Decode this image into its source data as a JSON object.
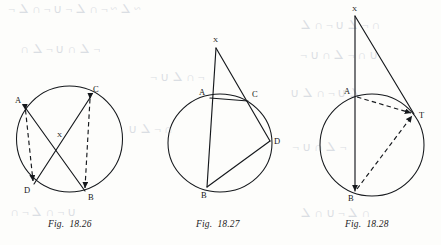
{
  "page": {
    "background_color": "#fdfdfb",
    "ink_color": "#15181c"
  },
  "figures": [
    {
      "id": "fig-18-26",
      "caption_prefix": "Fig.",
      "caption_number": "18.26",
      "circle": {
        "cx": 69.5,
        "cy": 139,
        "rx": 53,
        "ry": 53
      },
      "points": [
        {
          "name": "A",
          "x": 25.5,
          "y": 108,
          "label_x": 15,
          "label_y": 103
        },
        {
          "name": "C",
          "x": 90.5,
          "y": 97,
          "label_x": 93,
          "label_y": 92
        },
        {
          "name": "D",
          "x": 34,
          "y": 184,
          "label_x": 24,
          "label_y": 193
        },
        {
          "name": "B",
          "x": 85,
          "y": 191,
          "label_x": 88,
          "label_y": 200
        },
        {
          "name": "X",
          "x": 59,
          "y": 140,
          "label_x": 57,
          "label_y": 137
        }
      ],
      "solid_segments": [
        "A-B",
        "C-D"
      ],
      "dashed_segments": [
        "A-D",
        "C-B"
      ]
    },
    {
      "id": "fig-18-27",
      "caption_prefix": "Fig.",
      "caption_number": "18.27",
      "circle": {
        "cx": 220,
        "cy": 143,
        "rx": 52,
        "ry": 49
      },
      "points": [
        {
          "name": "X",
          "x": 216,
          "y": 48,
          "label_x": 213,
          "label_y": 42
        },
        {
          "name": "A",
          "x": 210,
          "y": 98,
          "label_x": 199,
          "label_y": 95
        },
        {
          "name": "C",
          "x": 248,
          "y": 101,
          "label_x": 252,
          "label_y": 97
        },
        {
          "name": "D",
          "x": 270,
          "y": 141,
          "label_x": 274,
          "label_y": 142
        },
        {
          "name": "B",
          "x": 207,
          "y": 187,
          "label_x": 201,
          "label_y": 198
        }
      ],
      "solid_segments": [
        "X-A",
        "A-B",
        "X-C",
        "C-D",
        "D-B"
      ],
      "dashed_segments": []
    },
    {
      "id": "fig-18-28",
      "caption_prefix": "Fig.",
      "caption_number": "18.28",
      "circle": {
        "cx": 372,
        "cy": 145,
        "rx": 52,
        "ry": 51
      },
      "points": [
        {
          "name": "X",
          "x": 355,
          "y": 16,
          "label_x": 352,
          "label_y": 11
        },
        {
          "name": "A",
          "x": 355,
          "y": 97,
          "label_x": 344,
          "label_y": 94
        },
        {
          "name": "T",
          "x": 414,
          "y": 114,
          "label_x": 419,
          "label_y": 115
        },
        {
          "name": "B",
          "x": 355,
          "y": 191,
          "label_x": 348,
          "label_y": 201
        }
      ],
      "solid_segments": [
        "X-B",
        "X-T"
      ],
      "dashed_segments": [
        "A-T",
        "B-T"
      ]
    }
  ]
}
